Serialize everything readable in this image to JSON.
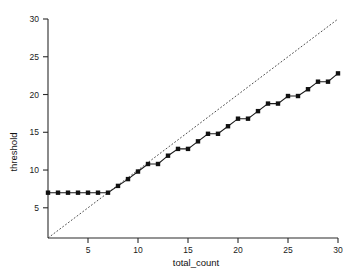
{
  "chart_data": {
    "type": "line",
    "title": "",
    "subtitle": "",
    "xlabel": "total_count",
    "ylabel": "threshold",
    "xlim": [
      1,
      30
    ],
    "ylim": [
      1,
      30
    ],
    "xticks": [
      5,
      10,
      15,
      20,
      25,
      30
    ],
    "yticks": [
      5,
      10,
      15,
      20,
      25,
      30
    ],
    "grid": false,
    "legend": "none",
    "series": [
      {
        "name": "threshold",
        "marker": "square",
        "linestyle": "solid",
        "color": "#111111",
        "x": [
          1,
          2,
          3,
          4,
          5,
          6,
          7,
          8,
          9,
          10,
          11,
          12,
          13,
          14,
          15,
          16,
          17,
          18,
          19,
          20,
          21,
          22,
          23,
          24,
          25,
          26,
          27,
          28,
          29,
          30
        ],
        "y": [
          7.0,
          7.0,
          7.0,
          7.0,
          7.0,
          7.0,
          7.0,
          7.9,
          8.8,
          9.8,
          10.8,
          10.8,
          11.9,
          12.8,
          12.8,
          13.8,
          14.8,
          14.8,
          15.8,
          16.8,
          16.8,
          17.8,
          18.8,
          18.8,
          19.8,
          19.8,
          20.7,
          21.7,
          21.7,
          22.8
        ]
      },
      {
        "name": "identity",
        "marker": "none",
        "linestyle": "dashed",
        "color": "#3a3a3a",
        "x": [
          1,
          30
        ],
        "y": [
          1,
          30
        ]
      }
    ],
    "annotations": []
  },
  "axes": {
    "x_tick_labels": [
      "5",
      "10",
      "15",
      "20",
      "25",
      "30"
    ],
    "y_tick_labels": [
      "5",
      "10",
      "15",
      "20",
      "25",
      "30"
    ],
    "x_axis_title": "total_count",
    "y_axis_title": "threshold"
  },
  "colors": {
    "background": "#ffffff",
    "axis": "#2b2b2b",
    "series": "#111111",
    "reference": "#3a3a3a",
    "text": "#1a1a1a"
  }
}
